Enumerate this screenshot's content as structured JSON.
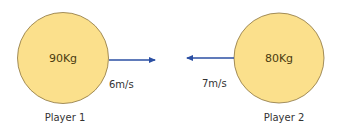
{
  "colors": {
    "ball_fill": "#fbe08c",
    "ball_stroke": "#8a7340",
    "arrow": "#2b4fa3"
  },
  "players": [
    {
      "name": "Player 1",
      "mass": "90Kg",
      "velocity": "6m/s",
      "direction": "right"
    },
    {
      "name": "Player 2",
      "mass": "80Kg",
      "velocity": "7m/s",
      "direction": "left"
    }
  ]
}
